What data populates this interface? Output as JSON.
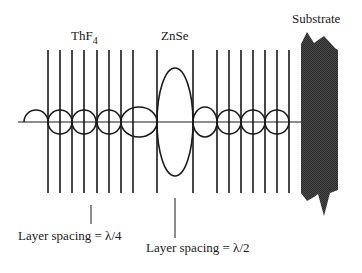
{
  "diagram": {
    "labels": {
      "thf4_main": "ThF",
      "thf4_sub": "4",
      "znse": "ZnSe",
      "substrate": "Substrate",
      "quarter_spacing": "Layer spacing = λ/4",
      "half_spacing": "Layer spacing = λ/2"
    },
    "materials": [
      "ThF4",
      "ZnSe",
      "Substrate"
    ],
    "substrate_color": "#3a3a3a",
    "line_color": "#1a1a1a"
  }
}
